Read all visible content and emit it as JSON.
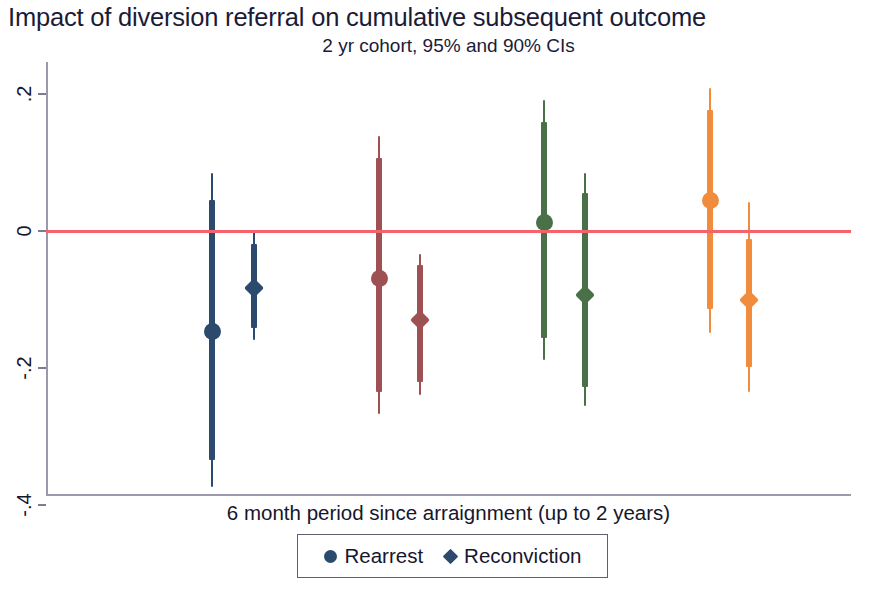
{
  "chart_data": {
    "type": "scatter",
    "title": "Impact of diversion referral on cumulative subsequent outcome",
    "subtitle": "2 yr cohort, 95% and 90% CIs",
    "xlabel": "6 month period since arraignment (up to 2 years)",
    "ylabel": "",
    "ylim": [
      -0.44,
      0.24
    ],
    "yticks": [
      0.2,
      0,
      -0.2,
      -0.4
    ],
    "ytick_labels": [
      ".2",
      "0",
      "-.2",
      "-.4"
    ],
    "grid": false,
    "zero_reference_line": {
      "value": 0,
      "color": "#f4636c"
    },
    "legend": {
      "position": "bottom-center",
      "entries": [
        {
          "label": "Rearrest",
          "marker": "circle",
          "color": "#2c4a6e"
        },
        {
          "label": "Reconviction",
          "marker": "diamond",
          "color": "#2c4a6e"
        }
      ]
    },
    "categories": [
      "Period 1",
      "Period 2",
      "Period 3",
      "Period 4"
    ],
    "series": [
      {
        "name": "Rearrest",
        "marker": "circle",
        "points": [
          {
            "group": "Period 1",
            "color": "#2c4a6e",
            "x_px": 210,
            "estimate": -0.146,
            "ci95_low": -0.374,
            "ci95_high": 0.085,
            "ci90_low": -0.334,
            "ci90_high": 0.045
          },
          {
            "group": "Period 2",
            "color": "#9e5152",
            "x_px": 377,
            "estimate": -0.069,
            "ci95_low": -0.267,
            "ci95_high": 0.139,
            "ci90_low": -0.235,
            "ci90_high": 0.107
          },
          {
            "group": "Period 3",
            "color": "#4a7048",
            "x_px": 542,
            "estimate": 0.013,
            "ci95_low": -0.189,
            "ci95_high": 0.191,
            "ci90_low": -0.156,
            "ci90_high": 0.159
          },
          {
            "group": "Period 4",
            "color": "#f08c3c",
            "x_px": 708,
            "estimate": 0.044,
            "ci95_low": -0.149,
            "ci95_high": 0.209,
            "ci90_low": -0.114,
            "ci90_high": 0.177
          }
        ]
      },
      {
        "name": "Reconviction",
        "marker": "diamond",
        "points": [
          {
            "group": "Period 1",
            "color": "#2c4a6e",
            "x_px": 252,
            "estimate": -0.083,
            "ci95_low": -0.159,
            "ci95_high": -0.002,
            "ci90_low": -0.142,
            "ci90_high": -0.019
          },
          {
            "group": "Period 2",
            "color": "#9e5152",
            "x_px": 418,
            "estimate": -0.13,
            "ci95_low": -0.239,
            "ci95_high": -0.033,
            "ci90_low": -0.22,
            "ci90_high": -0.049
          },
          {
            "group": "Period 3",
            "color": "#4a7048",
            "x_px": 583,
            "estimate": -0.093,
            "ci95_low": -0.256,
            "ci95_high": 0.084,
            "ci90_low": -0.228,
            "ci90_high": 0.055
          },
          {
            "group": "Period 4",
            "color": "#f08c3c",
            "x_px": 747,
            "estimate": -0.1,
            "ci95_low": -0.235,
            "ci95_high": 0.042,
            "ci90_low": -0.198,
            "ci90_high": -0.012
          }
        ]
      }
    ]
  }
}
